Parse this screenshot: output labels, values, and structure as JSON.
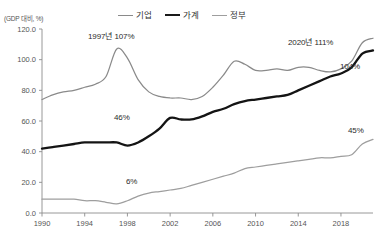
{
  "chart_data": {
    "type": "line",
    "title": "",
    "subtitle": "",
    "xlabel": "",
    "ylabel": "(GDP 대비, %)",
    "unit_note": "(GDP 대비, %)",
    "xlim": [
      1990,
      2021
    ],
    "ylim": [
      0.0,
      120.0
    ],
    "yticks": [
      "0.0",
      "20.0",
      "40.0",
      "60.0",
      "80.0",
      "100.0",
      "120.0"
    ],
    "ytick_values": [
      0.0,
      20.0,
      40.0,
      60.0,
      80.0,
      100.0,
      120.0
    ],
    "xticks": [
      "1990",
      "1994",
      "1998",
      "2002",
      "2006",
      "2010",
      "2014",
      "2018"
    ],
    "xtick_values": [
      1990,
      1994,
      1998,
      2002,
      2006,
      2010,
      2014,
      2018
    ],
    "grid": false,
    "legend_position": "top-center",
    "x": [
      1990,
      1991,
      1992,
      1993,
      1994,
      1995,
      1996,
      1997,
      1998,
      1999,
      2000,
      2001,
      2002,
      2003,
      2004,
      2005,
      2006,
      2007,
      2008,
      2009,
      2010,
      2011,
      2012,
      2013,
      2014,
      2015,
      2016,
      2017,
      2018,
      2019,
      2020,
      2021
    ],
    "series": [
      {
        "name": "기업",
        "color": "#8a8a8a",
        "values": [
          74,
          77,
          79,
          80,
          82,
          84,
          89,
          107,
          101,
          87,
          79,
          76,
          75,
          75,
          74,
          76,
          82,
          90,
          99,
          97,
          93,
          93,
          94,
          93,
          95,
          95,
          93,
          92,
          94,
          99,
          111,
          114
        ]
      },
      {
        "name": "가계",
        "color": "#141414",
        "values": [
          42,
          43,
          44,
          45,
          46,
          46,
          46,
          46,
          44,
          46,
          50,
          55,
          62,
          61,
          61,
          63,
          66,
          68,
          71,
          73,
          74,
          75,
          76,
          77,
          80,
          83,
          86,
          89,
          91,
          95,
          104,
          106
        ]
      },
      {
        "name": "정부",
        "color": "#9e9e9e",
        "values": [
          9,
          9,
          9,
          9,
          8,
          8,
          7,
          6,
          8,
          11,
          13,
          14,
          15,
          16,
          18,
          20,
          22,
          24,
          26,
          29,
          30,
          31,
          32,
          33,
          34,
          35,
          36,
          36,
          37,
          38,
          45,
          48
        ]
      }
    ],
    "annotations": [
      {
        "id": "peak-1997",
        "text": "1997년 107%",
        "x": 1997,
        "y": 107
      },
      {
        "id": "peak-2020",
        "text": "2020년 111%",
        "x": 2020,
        "y": 111
      },
      {
        "id": "house-2020",
        "text": "104%",
        "x": 2020,
        "y": 104
      },
      {
        "id": "house-1996",
        "text": "46%",
        "x": 1996,
        "y": 46
      },
      {
        "id": "gov-2020",
        "text": "45%",
        "x": 2020,
        "y": 45
      },
      {
        "id": "gov-1997",
        "text": "6%",
        "x": 1997,
        "y": 6
      }
    ]
  },
  "legend": {
    "items": [
      {
        "label": "기업"
      },
      {
        "label": "가계"
      },
      {
        "label": "정부"
      }
    ]
  },
  "colors": {
    "corporate": "#8a8a8a",
    "household": "#141414",
    "government": "#9e9e9e",
    "axis": "#8c8c8c",
    "background": "#ffffff"
  }
}
